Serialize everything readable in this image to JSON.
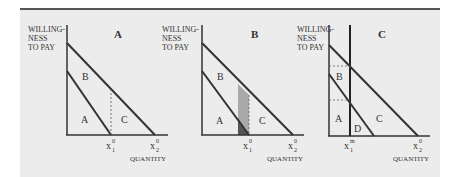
{
  "figure": {
    "panels": [
      {
        "id": "A",
        "title": "A",
        "ylabel": [
          "WILLING-",
          "NESS",
          "TO PAY"
        ],
        "xlabel": "QUANTITY",
        "regions": [
          "A",
          "B",
          "C"
        ],
        "ticks": [
          {
            "base": "x",
            "sub": "1",
            "sup": "0"
          },
          {
            "base": "x",
            "sub": "2",
            "sup": "0"
          }
        ]
      },
      {
        "id": "B",
        "title": "B",
        "ylabel": [
          "WILLING-",
          "NESS",
          "TO PAY"
        ],
        "xlabel": "QUANTITY",
        "regions": [
          "A",
          "B",
          "C"
        ],
        "ticks": [
          {
            "base": "x",
            "sub": "1",
            "sup": "0"
          },
          {
            "base": "x",
            "sub": "2",
            "sup": "0"
          }
        ]
      },
      {
        "id": "C",
        "title": "C",
        "ylabel": [
          "WILLING-",
          "NESS",
          "TO PAY"
        ],
        "xlabel": "QUANTITY",
        "regions": [
          "A",
          "B",
          "C",
          "D"
        ],
        "ticks": [
          {
            "base": "x",
            "sub": "1",
            "sup": "m"
          },
          {
            "base": "x",
            "sub": "2",
            "sup": "0"
          }
        ]
      }
    ],
    "colors": {
      "background": "#ececec",
      "line": "#333333",
      "shade_light": "#a9a9a9",
      "shade_dark": "#555555"
    }
  }
}
